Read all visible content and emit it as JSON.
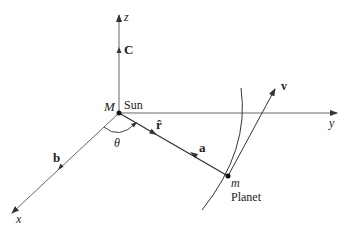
{
  "diagram": {
    "title": "",
    "colors": {
      "ink": "#222222",
      "axis": "#555555"
    },
    "axes": {
      "x": {
        "label": "x"
      },
      "y": {
        "label": "y"
      },
      "z": {
        "label": "z"
      }
    },
    "sun": {
      "mass_label": "M",
      "name": "Sun"
    },
    "planet": {
      "mass_label": "m",
      "name": "Planet"
    },
    "vectors": {
      "C": {
        "label": "C"
      },
      "b": {
        "label": "b"
      },
      "r_hat": {
        "label": "r̂"
      },
      "a": {
        "label": "a"
      },
      "v": {
        "label": "v"
      }
    },
    "angle": {
      "label": "θ"
    }
  }
}
